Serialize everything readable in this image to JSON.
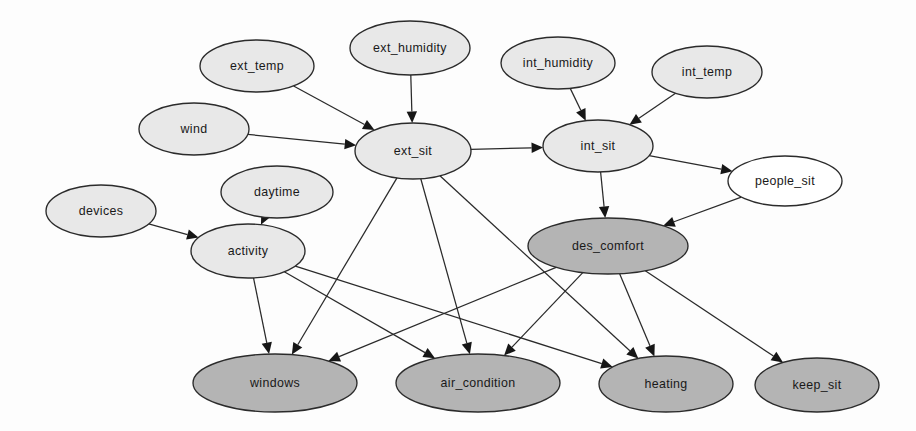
{
  "diagram": {
    "type": "directed-acyclic-graph",
    "background_color": "#fdfdfd",
    "edge_color": "#2a2a2a",
    "node_border_color": "#2b2b2b",
    "fill_styles": {
      "light_gray": "#e8e8e8",
      "dark_gray": "#b4b4b4",
      "white": "#ffffff"
    },
    "nodes": [
      {
        "id": "ext_temp",
        "label": "ext_temp",
        "cx": 257,
        "cy": 66,
        "rx": 57,
        "ry": 26,
        "fill": "#e8e8e8"
      },
      {
        "id": "ext_humidity",
        "label": "ext_humidity",
        "cx": 410,
        "cy": 48,
        "rx": 60,
        "ry": 27,
        "fill": "#e8e8e8"
      },
      {
        "id": "int_humidity",
        "label": "int_humidity",
        "cx": 558,
        "cy": 63,
        "rx": 57,
        "ry": 26,
        "fill": "#e8e8e8"
      },
      {
        "id": "int_temp",
        "label": "int_temp",
        "cx": 707,
        "cy": 72,
        "rx": 55,
        "ry": 26,
        "fill": "#e8e8e8"
      },
      {
        "id": "wind",
        "label": "wind",
        "cx": 194,
        "cy": 129,
        "rx": 55,
        "ry": 26,
        "fill": "#e8e8e8"
      },
      {
        "id": "ext_sit",
        "label": "ext_sit",
        "cx": 413,
        "cy": 151,
        "rx": 58,
        "ry": 28,
        "fill": "#e8e8e8"
      },
      {
        "id": "int_sit",
        "label": "int_sit",
        "cx": 598,
        "cy": 146,
        "rx": 55,
        "ry": 26,
        "fill": "#e8e8e8"
      },
      {
        "id": "people_sit",
        "label": "people_sit",
        "cx": 785,
        "cy": 181,
        "rx": 57,
        "ry": 25,
        "fill": "#ffffff"
      },
      {
        "id": "daytime",
        "label": "daytime",
        "cx": 277,
        "cy": 192,
        "rx": 56,
        "ry": 26,
        "fill": "#e8e8e8"
      },
      {
        "id": "devices",
        "label": "devices",
        "cx": 101,
        "cy": 211,
        "rx": 55,
        "ry": 26,
        "fill": "#e8e8e8"
      },
      {
        "id": "activity",
        "label": "activity",
        "cx": 248,
        "cy": 251,
        "rx": 57,
        "ry": 27,
        "fill": "#e8e8e8"
      },
      {
        "id": "des_comfort",
        "label": "des_comfort",
        "cx": 608,
        "cy": 246,
        "rx": 80,
        "ry": 28,
        "fill": "#b4b4b4"
      },
      {
        "id": "windows",
        "label": "windows",
        "cx": 275,
        "cy": 383,
        "rx": 82,
        "ry": 29,
        "fill": "#b4b4b4"
      },
      {
        "id": "air_condition",
        "label": "air_condition",
        "cx": 478,
        "cy": 383,
        "rx": 82,
        "ry": 29,
        "fill": "#b4b4b4"
      },
      {
        "id": "heating",
        "label": "heating",
        "cx": 666,
        "cy": 384,
        "rx": 67,
        "ry": 28,
        "fill": "#b4b4b4"
      },
      {
        "id": "keep_sit",
        "label": "keep_sit",
        "cx": 817,
        "cy": 385,
        "rx": 62,
        "ry": 27,
        "fill": "#b4b4b4"
      }
    ],
    "edges": [
      {
        "from": "ext_temp",
        "to": "ext_sit",
        "name": "edge-ext-temp-to-ext-sit"
      },
      {
        "from": "ext_humidity",
        "to": "ext_sit",
        "name": "edge-ext-humidity-to-ext-sit"
      },
      {
        "from": "wind",
        "to": "ext_sit",
        "name": "edge-wind-to-ext-sit"
      },
      {
        "from": "int_humidity",
        "to": "int_sit",
        "name": "edge-int-humidity-to-int-sit"
      },
      {
        "from": "int_temp",
        "to": "int_sit",
        "name": "edge-int-temp-to-int-sit"
      },
      {
        "from": "ext_sit",
        "to": "int_sit",
        "name": "edge-ext-sit-to-int-sit"
      },
      {
        "from": "int_sit",
        "to": "people_sit",
        "name": "edge-int-sit-to-people-sit"
      },
      {
        "from": "int_sit",
        "to": "des_comfort",
        "name": "edge-int-sit-to-des-comfort"
      },
      {
        "from": "people_sit",
        "to": "des_comfort",
        "name": "edge-people-sit-to-des-comfort"
      },
      {
        "from": "devices",
        "to": "activity",
        "name": "edge-devices-to-activity"
      },
      {
        "from": "daytime",
        "to": "activity",
        "name": "edge-daytime-to-activity"
      },
      {
        "from": "activity",
        "to": "windows",
        "name": "edge-activity-to-windows"
      },
      {
        "from": "activity",
        "to": "air_condition",
        "name": "edge-activity-to-air-condition"
      },
      {
        "from": "activity",
        "to": "heating",
        "name": "edge-activity-to-heating"
      },
      {
        "from": "ext_sit",
        "to": "windows",
        "name": "edge-ext-sit-to-windows"
      },
      {
        "from": "ext_sit",
        "to": "air_condition",
        "name": "edge-ext-sit-to-air-condition"
      },
      {
        "from": "ext_sit",
        "to": "heating",
        "name": "edge-ext-sit-to-heating"
      },
      {
        "from": "des_comfort",
        "to": "windows",
        "name": "edge-des-comfort-to-windows"
      },
      {
        "from": "des_comfort",
        "to": "air_condition",
        "name": "edge-des-comfort-to-air-condition"
      },
      {
        "from": "des_comfort",
        "to": "heating",
        "name": "edge-des-comfort-to-heating"
      },
      {
        "from": "des_comfort",
        "to": "keep_sit",
        "name": "edge-des-comfort-to-keep-sit"
      }
    ]
  }
}
